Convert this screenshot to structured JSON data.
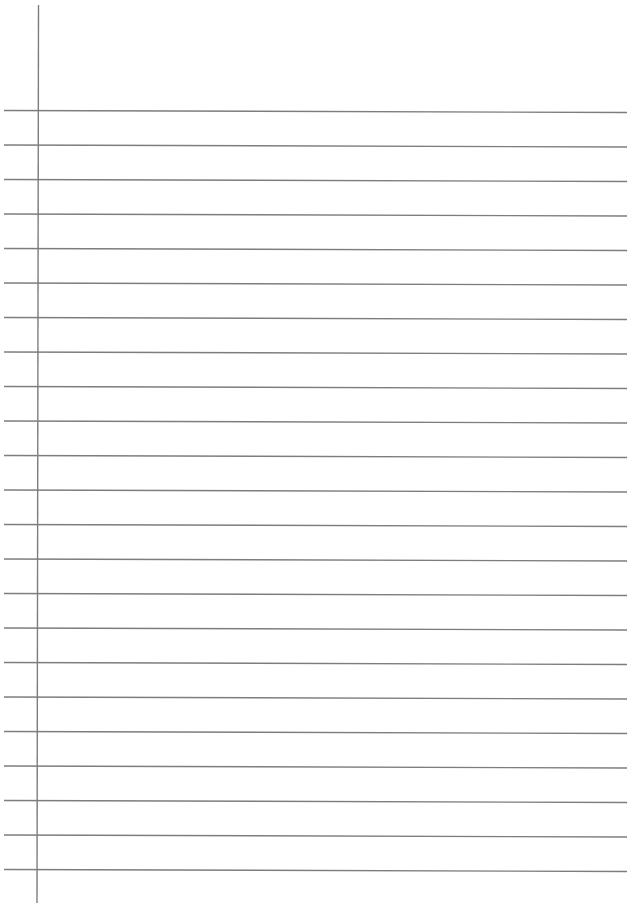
{
  "page": {
    "type": "lined-paper",
    "background": "#ffffff",
    "line_color": "#7d7d7d",
    "margin_line": {
      "x_top": 38.5,
      "x_bottom": 37,
      "y_start": 5,
      "y_end": 903
    },
    "rule_lines": {
      "count": 23,
      "first_y": 110.5,
      "spacing": 34.5,
      "x_start": 4,
      "x_end": 627,
      "slope_px": 2
    }
  }
}
